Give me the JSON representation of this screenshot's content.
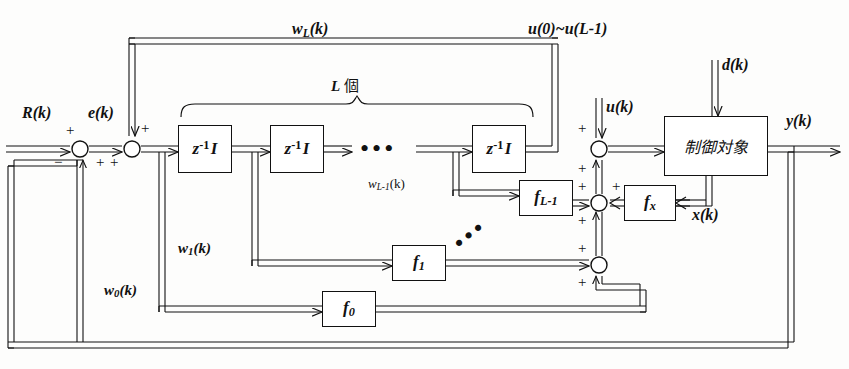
{
  "diagram": {
    "language": "ja",
    "canvas": {
      "width": 849,
      "height": 369
    },
    "colors": {
      "line": "#111111",
      "background": "#fdfdfc",
      "block_fill": "#ffffff"
    }
  },
  "blocks": [
    {
      "id": "delay1",
      "label_main": "z",
      "label_sup": "-1",
      "label_post": "I",
      "kind": "unit-delay"
    },
    {
      "id": "delay2",
      "label_main": "z",
      "label_sup": "-1",
      "label_post": "I",
      "kind": "unit-delay"
    },
    {
      "id": "delayL",
      "label_main": "z",
      "label_sup": "-1",
      "label_post": "I",
      "kind": "unit-delay"
    },
    {
      "id": "fLm1",
      "label_main": "f",
      "label_sub": "L-1",
      "kind": "gain"
    },
    {
      "id": "f1",
      "label_main": "f",
      "label_sub": "1",
      "kind": "gain"
    },
    {
      "id": "f0",
      "label_main": "f",
      "label_sub": "0",
      "kind": "gain"
    },
    {
      "id": "fx",
      "label_main": "f",
      "label_sub": "x",
      "kind": "gain"
    },
    {
      "id": "plant",
      "label_main": "制御対象",
      "kind": "plant"
    }
  ],
  "signals": {
    "reference": "R(k)",
    "error": "e(k)",
    "preview_bus": "w",
    "preview_bus_sub": "L",
    "preview_bus_post": "(k)",
    "preview_inputs": "u(0)~u(L-1)",
    "control_input": "u(k)",
    "disturbance": "d(k)",
    "output": "y(k)",
    "state": "x(k)",
    "tap_Lm1": "w",
    "tap_Lm1_sub": "L-1",
    "tap_Lm1_post": "(k)",
    "tap_1": "w",
    "tap_1_sub": "1",
    "tap_1_post": "(k)",
    "tap_0": "w",
    "tap_0_sub": "0",
    "tap_0_post": "(k)"
  },
  "annotations": {
    "count_brace": "L 個",
    "count_symbol": "L",
    "count_unit": "個",
    "ellipsis": "•••"
  },
  "signs": {
    "sum1_top": "+",
    "sum1_bottom_left": "−",
    "sum1_bottom_right": "+",
    "sum2_top": "+",
    "sum2_bottom": "+",
    "sum_u_top": "+",
    "sum_u_bottom": "+",
    "sum_mid_left": "+",
    "sum_mid_right": "+",
    "sum_mid_bottom": "+",
    "sum_low_top": "+",
    "sum_low_bottom": "+"
  }
}
